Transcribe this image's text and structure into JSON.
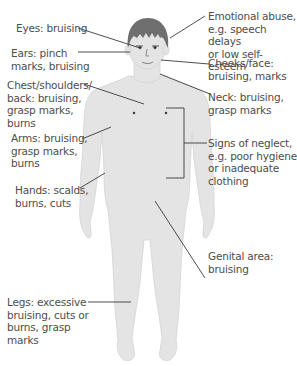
{
  "diagram": {
    "title": "",
    "figure_description": "child-body-outline",
    "colors": {
      "body_fill": "#e4e4e4",
      "body_edge": "#d2d2d2",
      "hair": "#6b6b6b",
      "leader_line": "#3a3a3a",
      "text": "#4d4d4d"
    },
    "labels_left": [
      {
        "id": "eyes",
        "text": "Eyes: bruising"
      },
      {
        "id": "ears",
        "text": "Ears: pinch\nmarks, bruising"
      },
      {
        "id": "chest",
        "text": "Chest/shoulders/\nback: bruising,\ngrasp marks,\nburns"
      },
      {
        "id": "arms",
        "text": "Arms: bruising,\ngrasp marks,\nburns"
      },
      {
        "id": "hands",
        "text": "Hands: scalds,\nburns, cuts"
      },
      {
        "id": "legs",
        "text": "Legs: excessive\nbruising, cuts or\nburns, grasp\nmarks"
      }
    ],
    "labels_right": [
      {
        "id": "emotional",
        "text": "Emotional abuse,\ne.g. speech delays\nor low self-esteem"
      },
      {
        "id": "cheeks",
        "text": "Cheeks/face:\nbruising, marks"
      },
      {
        "id": "neck",
        "text": "Neck: bruising,\ngrasp marks"
      },
      {
        "id": "neglect",
        "text": "Signs of neglect,\ne.g. poor hygiene\nor inadequate\nclothing"
      },
      {
        "id": "genital",
        "text": "Genital area:\nbruising"
      }
    ]
  }
}
